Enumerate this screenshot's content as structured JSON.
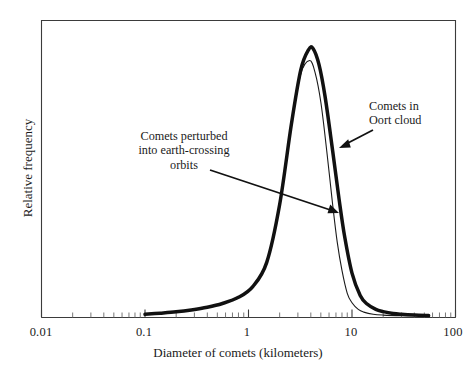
{
  "chart_data": {
    "type": "line",
    "title": "",
    "xlabel": "Diameter of comets (kilometers)",
    "ylabel": "Relative frequency",
    "xscale": "log",
    "xlim": [
      0.01,
      100
    ],
    "ylim": [
      0,
      1.05
    ],
    "grid": false,
    "legend": "none",
    "xticks": [
      "0.01",
      "0.1",
      "1",
      "10",
      "100"
    ],
    "xtick_values": [
      0.01,
      0.1,
      1,
      10,
      100
    ],
    "yticks": [],
    "series": [
      {
        "name": "Comets in Oort cloud",
        "style": "thick",
        "peak_x": 4.2,
        "peak_y": 1.0,
        "x": [
          0.1,
          0.14,
          0.2,
          0.28,
          0.4,
          0.56,
          0.8,
          1.1,
          1.5,
          2.0,
          2.6,
          3.2,
          3.8,
          4.2,
          4.8,
          5.5,
          6.5,
          7.5,
          8.5,
          10,
          12,
          14,
          17,
          20,
          25,
          30,
          40,
          55
        ],
        "y": [
          0.012,
          0.016,
          0.021,
          0.028,
          0.038,
          0.052,
          0.075,
          0.115,
          0.205,
          0.42,
          0.72,
          0.92,
          0.995,
          1.0,
          0.94,
          0.82,
          0.62,
          0.44,
          0.3,
          0.165,
          0.082,
          0.05,
          0.03,
          0.022,
          0.015,
          0.012,
          0.009,
          0.007
        ]
      },
      {
        "name": "Comets perturbed into earth-crossing orbits",
        "style": "thin",
        "peak_x": 3.9,
        "peak_y": 0.955,
        "x": [
          0.1,
          0.14,
          0.2,
          0.28,
          0.4,
          0.56,
          0.8,
          1.1,
          1.5,
          2.0,
          2.6,
          3.2,
          3.9,
          4.4,
          5.0,
          5.7,
          6.5,
          7.2,
          8.0,
          9.0,
          10,
          11.5,
          13,
          16,
          20,
          30,
          55
        ],
        "y": [
          0.012,
          0.016,
          0.021,
          0.028,
          0.038,
          0.052,
          0.075,
          0.115,
          0.205,
          0.42,
          0.72,
          0.905,
          0.955,
          0.91,
          0.8,
          0.62,
          0.42,
          0.28,
          0.175,
          0.09,
          0.055,
          0.03,
          0.02,
          0.012,
          0.009,
          0.007,
          0.006
        ]
      }
    ],
    "annotations": [
      {
        "id": "earth-crossing",
        "text": "Comets perturbed\ninto earth-crossing\norbits",
        "arrow_from": [
          210,
          170
        ],
        "arrow_to": [
          338,
          212
        ]
      },
      {
        "id": "oort-cloud",
        "text": "Comets in\nOort cloud",
        "arrow_from": [
          373,
          130
        ],
        "arrow_to": [
          340,
          147
        ]
      }
    ],
    "colors": {
      "curve_thick": "#111111",
      "curve_thin": "#1a1a1a",
      "axis": "#3b3b3b",
      "text": "#1a1a1a",
      "background": "#ffffff"
    }
  },
  "axis": {
    "x_title": "Diameter of comets (kilometers)",
    "y_title": "Relative frequency",
    "x_tick_labels": [
      "0.01",
      "0.1",
      "1",
      "10",
      "100"
    ]
  },
  "annotations": {
    "earth_crossing": "Comets perturbed\ninto earth-crossing\norbits",
    "oort_cloud": "Comets in\nOort cloud"
  }
}
